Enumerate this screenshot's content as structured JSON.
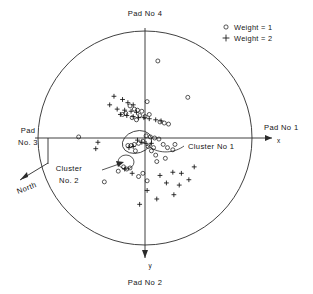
{
  "figure": {
    "title_visible": false,
    "background_color": "#ffffff",
    "ink_color": "#2b2b2b"
  },
  "labels": {
    "pad4": "Pad No 4",
    "pad1": "Pad No 1",
    "pad3_line1": "Pad",
    "pad3_line2": "No. 3",
    "pad2": "Pad No 2",
    "north": "North",
    "axis_x": "x",
    "axis_y": "y",
    "cluster1": "Cluster  No 1",
    "cluster2_line1": "Cluster",
    "cluster2_line2": "No. 2"
  },
  "legend": {
    "position": "top-right",
    "entries": [
      {
        "marker": "circle-marker",
        "label": "Weight = 1"
      },
      {
        "marker": "plus-marker",
        "label": "Weight = 2"
      }
    ]
  },
  "chart_data": {
    "type": "scatter",
    "title": "",
    "xlabel": "x",
    "ylabel": "y",
    "grid": false,
    "legend_position": "top-right",
    "boundary": {
      "shape": "circle",
      "center_x": 0,
      "center_y": 0,
      "radius": 1.0
    },
    "xlim": [
      -1.08,
      1.08
    ],
    "ylim": [
      -1.08,
      1.08
    ],
    "axis_note": "y axis increases downward (plan view); x axis to the right toward Pad No 1",
    "annotations": [
      {
        "text": "Cluster  No 1",
        "target_x": 0.03,
        "target_y": 0.05,
        "label_x": 0.42,
        "label_y": 0.1
      },
      {
        "text": "Cluster No. 2",
        "target_x": -0.2,
        "target_y": 0.29,
        "label_x": -0.62,
        "label_y": 0.36
      },
      {
        "text": "North",
        "target_x": -0.82,
        "target_y": 0.42,
        "label_x": -1.02,
        "label_y": 0.52
      },
      {
        "text": "Pad No 4",
        "target_x": 0.0,
        "target_y": -1.0,
        "label_x": 0.0,
        "label_y": -1.18
      },
      {
        "text": "Pad No 2",
        "target_x": 0.0,
        "target_y": 1.0,
        "label_x": 0.0,
        "label_y": 1.3
      },
      {
        "text": "Pad No 1",
        "target_x": 1.0,
        "target_y": 0.0,
        "label_x": 1.18,
        "label_y": -0.09
      },
      {
        "text": "Pad No. 3",
        "target_x": -1.0,
        "target_y": 0.0,
        "label_x": -1.18,
        "label_y": -0.09
      }
    ],
    "series": [
      {
        "name": "Weight = 1",
        "marker": "circle",
        "count": 46,
        "points": [
          [
            0.12,
            -0.72
          ],
          [
            0.4,
            -0.38
          ],
          [
            0.02,
            -0.34
          ],
          [
            -0.14,
            -0.3
          ],
          [
            -0.1,
            -0.27
          ],
          [
            -0.07,
            -0.26
          ],
          [
            -0.03,
            -0.25
          ],
          [
            -0.18,
            -0.23
          ],
          [
            -0.21,
            -0.22
          ],
          [
            -0.05,
            -0.21
          ],
          [
            0.0,
            -0.2
          ],
          [
            0.04,
            -0.22
          ],
          [
            -0.12,
            -0.19
          ],
          [
            -0.08,
            -0.17
          ],
          [
            0.14,
            -0.15
          ],
          [
            0.18,
            -0.14
          ],
          [
            0.22,
            -0.13
          ],
          [
            -0.62,
            -0.01
          ],
          [
            0.01,
            -0.02
          ],
          [
            0.05,
            -0.01
          ],
          [
            0.09,
            0.0
          ],
          [
            0.13,
            0.01
          ],
          [
            -0.02,
            0.03
          ],
          [
            -0.06,
            0.05
          ],
          [
            -0.1,
            0.06
          ],
          [
            -0.13,
            0.07
          ],
          [
            -0.16,
            0.07
          ],
          [
            0.03,
            0.08
          ],
          [
            0.08,
            0.09
          ],
          [
            0.17,
            0.06
          ],
          [
            0.21,
            0.09
          ],
          [
            0.26,
            0.11
          ],
          [
            0.1,
            0.16
          ],
          [
            0.19,
            0.19
          ],
          [
            -0.2,
            0.27
          ],
          [
            -0.17,
            0.29
          ],
          [
            -0.14,
            0.28
          ],
          [
            0.11,
            0.22
          ],
          [
            -0.02,
            0.33
          ],
          [
            -0.06,
            0.36
          ],
          [
            0.02,
            0.4
          ],
          [
            -0.38,
            0.41
          ],
          [
            -0.25,
            0.31
          ],
          [
            0.28,
            0.06
          ],
          [
            0.06,
            0.12
          ],
          [
            -0.09,
            0.12
          ]
        ]
      },
      {
        "name": "Weight = 2",
        "marker": "plus",
        "count": 38,
        "points": [
          [
            -0.29,
            -0.39
          ],
          [
            -0.21,
            -0.36
          ],
          [
            -0.33,
            -0.31
          ],
          [
            -0.16,
            -0.33
          ],
          [
            -0.11,
            -0.31
          ],
          [
            -0.26,
            -0.27
          ],
          [
            -0.19,
            -0.26
          ],
          [
            -0.13,
            -0.25
          ],
          [
            -0.08,
            -0.24
          ],
          [
            -0.23,
            -0.22
          ],
          [
            -0.17,
            -0.21
          ],
          [
            -0.11,
            -0.2
          ],
          [
            -0.06,
            -0.19
          ],
          [
            -0.01,
            -0.19
          ],
          [
            0.04,
            -0.18
          ],
          [
            0.1,
            -0.17
          ],
          [
            0.15,
            -0.16
          ],
          [
            -0.44,
            0.04
          ],
          [
            -0.07,
            0.02
          ],
          [
            -0.03,
            0.04
          ],
          [
            0.01,
            0.05
          ],
          [
            0.06,
            0.05
          ],
          [
            -0.11,
            0.08
          ],
          [
            -0.15,
            0.09
          ],
          [
            -0.19,
            0.29
          ],
          [
            -0.12,
            0.33
          ],
          [
            -0.46,
            0.1
          ],
          [
            0.14,
            0.35
          ],
          [
            0.26,
            0.32
          ],
          [
            0.34,
            0.33
          ],
          [
            0.2,
            0.42
          ],
          [
            0.32,
            0.44
          ],
          [
            0.41,
            0.39
          ],
          [
            0.27,
            0.53
          ],
          [
            0.11,
            0.57
          ],
          [
            -0.05,
            0.62
          ],
          [
            0.02,
            0.49
          ],
          [
            0.46,
            0.27
          ]
        ]
      }
    ]
  }
}
